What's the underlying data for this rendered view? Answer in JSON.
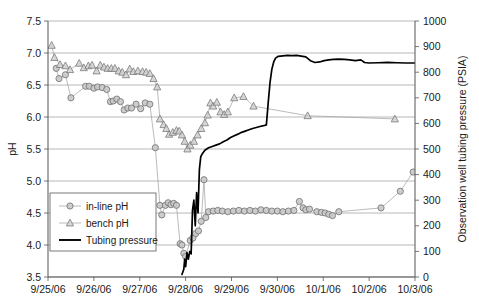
{
  "chart_data": {
    "type": "line",
    "title": "",
    "xlabel": "",
    "ylabel": "pH",
    "y2label": "Observation well tubing pressure (PSIA)",
    "grid": true,
    "legend_position": "inside-lower-left",
    "xlim": [
      "9/25/06",
      "10/3/06"
    ],
    "xtick_labels": [
      "9/25/06",
      "9/26/06",
      "9/27/06",
      "9/28/06",
      "9/29/06",
      "9/30/06",
      "10/1/06",
      "10/2/06",
      "10/3/06"
    ],
    "ylim": [
      3.5,
      7.5
    ],
    "ytick_labels": [
      "3.5",
      "4.0",
      "4.5",
      "5.0",
      "5.5",
      "6.0",
      "6.5",
      "7.0",
      "7.5"
    ],
    "y2lim": [
      0,
      1000
    ],
    "y2tick_labels": [
      "0",
      "100",
      "200",
      "300",
      "400",
      "500",
      "600",
      "700",
      "800",
      "900",
      "1000"
    ],
    "series": [
      {
        "name": "in-line pH",
        "marker": "circle",
        "axis": "left",
        "color": "#9a9a9a",
        "points": [
          [
            0.18,
            6.76
          ],
          [
            0.24,
            6.6
          ],
          [
            0.38,
            6.66
          ],
          [
            0.5,
            6.3
          ],
          [
            0.82,
            6.48
          ],
          [
            0.9,
            6.48
          ],
          [
            1.0,
            6.45
          ],
          [
            1.08,
            6.47
          ],
          [
            1.18,
            6.46
          ],
          [
            1.28,
            6.43
          ],
          [
            1.36,
            6.24
          ],
          [
            1.42,
            6.25
          ],
          [
            1.5,
            6.28
          ],
          [
            1.58,
            6.24
          ],
          [
            1.66,
            6.11
          ],
          [
            1.74,
            6.14
          ],
          [
            1.82,
            6.14
          ],
          [
            1.92,
            6.2
          ],
          [
            2.02,
            6.13
          ],
          [
            2.12,
            6.22
          ],
          [
            2.22,
            6.2
          ],
          [
            2.34,
            5.52
          ],
          [
            2.44,
            4.62
          ],
          [
            2.48,
            4.47
          ],
          [
            2.56,
            4.62
          ],
          [
            2.62,
            4.66
          ],
          [
            2.68,
            4.63
          ],
          [
            2.74,
            4.65
          ],
          [
            2.8,
            4.62
          ],
          [
            2.88,
            4.02
          ],
          [
            2.92,
            4.0
          ],
          [
            2.96,
            3.87
          ],
          [
            3.0,
            3.82
          ],
          [
            3.1,
            4.07
          ],
          [
            3.16,
            4.11
          ],
          [
            3.22,
            4.18
          ],
          [
            3.28,
            4.22
          ],
          [
            3.34,
            4.37
          ],
          [
            3.4,
            5.02
          ],
          [
            3.44,
            4.43
          ],
          [
            3.5,
            4.52
          ],
          [
            3.6,
            4.53
          ],
          [
            3.7,
            4.54
          ],
          [
            3.8,
            4.53
          ],
          [
            3.92,
            4.52
          ],
          [
            4.04,
            4.53
          ],
          [
            4.16,
            4.54
          ],
          [
            4.28,
            4.53
          ],
          [
            4.4,
            4.54
          ],
          [
            4.52,
            4.53
          ],
          [
            4.64,
            4.55
          ],
          [
            4.76,
            4.54
          ],
          [
            4.88,
            4.53
          ],
          [
            5.0,
            4.53
          ],
          [
            5.12,
            4.52
          ],
          [
            5.24,
            4.53
          ],
          [
            5.36,
            4.54
          ],
          [
            5.48,
            4.68
          ],
          [
            5.56,
            4.58
          ],
          [
            5.62,
            4.55
          ],
          [
            5.7,
            4.56
          ],
          [
            5.86,
            4.52
          ],
          [
            5.96,
            4.51
          ],
          [
            6.04,
            4.5
          ],
          [
            6.12,
            4.48
          ],
          [
            6.2,
            4.46
          ],
          [
            6.34,
            4.52
          ],
          [
            7.26,
            4.58
          ],
          [
            7.68,
            4.84
          ],
          [
            7.96,
            5.14
          ]
        ]
      },
      {
        "name": "bench pH",
        "marker": "triangle",
        "axis": "left",
        "color": "#9a9a9a",
        "points": [
          [
            0.08,
            7.12
          ],
          [
            0.14,
            6.93
          ],
          [
            0.26,
            6.82
          ],
          [
            0.38,
            6.8
          ],
          [
            0.48,
            6.74
          ],
          [
            0.68,
            6.84
          ],
          [
            0.78,
            6.77
          ],
          [
            0.88,
            6.8
          ],
          [
            0.96,
            6.81
          ],
          [
            1.06,
            6.72
          ],
          [
            1.14,
            6.81
          ],
          [
            1.22,
            6.78
          ],
          [
            1.3,
            6.76
          ],
          [
            1.38,
            6.76
          ],
          [
            1.46,
            6.76
          ],
          [
            1.54,
            6.72
          ],
          [
            1.62,
            6.7
          ],
          [
            1.7,
            6.66
          ],
          [
            1.78,
            6.75
          ],
          [
            1.86,
            6.71
          ],
          [
            1.96,
            6.72
          ],
          [
            2.06,
            6.71
          ],
          [
            2.14,
            6.7
          ],
          [
            2.22,
            6.68
          ],
          [
            2.3,
            6.6
          ],
          [
            2.38,
            6.47
          ],
          [
            2.44,
            5.97
          ],
          [
            2.52,
            5.88
          ],
          [
            2.58,
            5.82
          ],
          [
            2.64,
            5.73
          ],
          [
            2.72,
            5.76
          ],
          [
            2.8,
            5.79
          ],
          [
            2.86,
            5.78
          ],
          [
            2.92,
            5.72
          ],
          [
            2.98,
            5.62
          ],
          [
            3.04,
            5.5
          ],
          [
            3.1,
            5.56
          ],
          [
            3.18,
            5.62
          ],
          [
            3.26,
            5.72
          ],
          [
            3.34,
            5.82
          ],
          [
            3.42,
            5.91
          ],
          [
            3.48,
            6.03
          ],
          [
            3.54,
            6.22
          ],
          [
            3.6,
            6.17
          ],
          [
            3.68,
            6.23
          ],
          [
            3.76,
            6.08
          ],
          [
            3.84,
            6.04
          ],
          [
            3.92,
            6.08
          ],
          [
            4.06,
            6.3
          ],
          [
            4.26,
            6.32
          ],
          [
            4.48,
            6.17
          ],
          [
            5.66,
            6.02
          ],
          [
            7.56,
            5.97
          ]
        ]
      },
      {
        "name": "Tubing pressure",
        "marker": "none",
        "axis": "right",
        "color": "#000000",
        "points": [
          [
            2.92,
            10
          ],
          [
            2.96,
            30
          ],
          [
            2.98,
            70
          ],
          [
            3.0,
            40
          ],
          [
            3.03,
            95
          ],
          [
            3.06,
            70
          ],
          [
            3.09,
            100
          ],
          [
            3.12,
            90
          ],
          [
            3.15,
            260
          ],
          [
            3.18,
            300
          ],
          [
            3.21,
            200
          ],
          [
            3.24,
            330
          ],
          [
            3.27,
            250
          ],
          [
            3.3,
            420
          ],
          [
            3.33,
            470
          ],
          [
            3.36,
            480
          ],
          [
            3.42,
            495
          ],
          [
            3.5,
            505
          ],
          [
            3.58,
            510
          ],
          [
            3.66,
            515
          ],
          [
            3.74,
            520
          ],
          [
            3.82,
            528
          ],
          [
            3.9,
            535
          ],
          [
            3.98,
            545
          ],
          [
            4.06,
            552
          ],
          [
            4.14,
            558
          ],
          [
            4.22,
            565
          ],
          [
            4.3,
            570
          ],
          [
            4.38,
            575
          ],
          [
            4.46,
            580
          ],
          [
            4.54,
            584
          ],
          [
            4.62,
            588
          ],
          [
            4.7,
            591
          ],
          [
            4.76,
            594
          ],
          [
            4.8,
            680
          ],
          [
            4.84,
            760
          ],
          [
            4.88,
            812
          ],
          [
            4.92,
            840
          ],
          [
            4.96,
            855
          ],
          [
            5.02,
            862
          ],
          [
            5.12,
            864
          ],
          [
            5.22,
            866
          ],
          [
            5.32,
            865
          ],
          [
            5.42,
            866
          ],
          [
            5.52,
            863
          ],
          [
            5.62,
            860
          ],
          [
            5.72,
            845
          ],
          [
            5.82,
            838
          ],
          [
            5.92,
            840
          ],
          [
            6.02,
            845
          ],
          [
            6.12,
            848
          ],
          [
            6.22,
            850
          ],
          [
            6.34,
            851
          ],
          [
            6.46,
            850
          ],
          [
            6.58,
            848
          ],
          [
            6.7,
            845
          ],
          [
            6.82,
            848
          ],
          [
            6.9,
            838
          ],
          [
            7.0,
            836
          ],
          [
            7.2,
            837
          ],
          [
            7.4,
            838
          ],
          [
            7.6,
            837
          ],
          [
            7.8,
            836
          ],
          [
            8.0,
            836
          ]
        ]
      }
    ],
    "legend": [
      {
        "label": "in-line pH",
        "marker": "circle"
      },
      {
        "label": "bench pH",
        "marker": "triangle"
      },
      {
        "label": "Tubing pressure",
        "marker": "line"
      }
    ]
  }
}
